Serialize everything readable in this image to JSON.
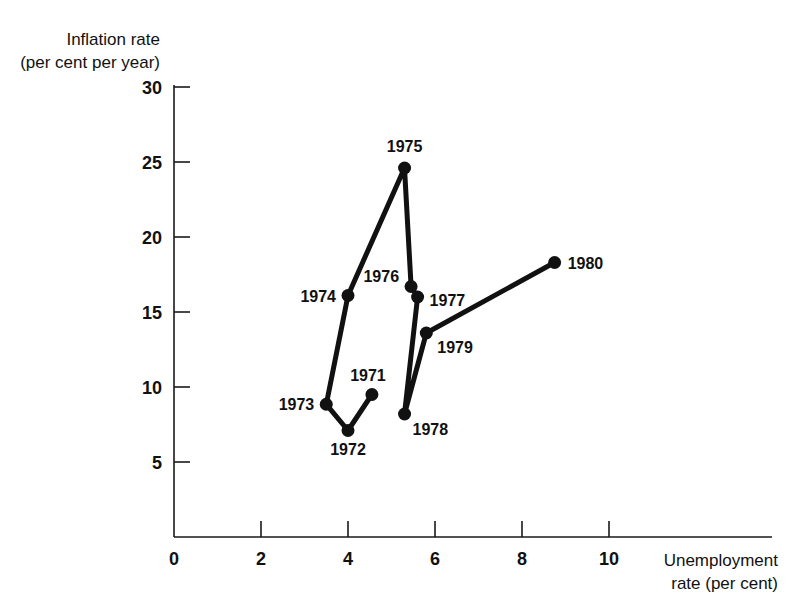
{
  "chart_data": {
    "type": "line",
    "title": "",
    "subtitle": "",
    "xlabel": "Unemployment rate (per cent)",
    "ylabel": "Inflation rate (per cent per year)",
    "xlabel_line1": "Unemployment",
    "xlabel_line2": "rate (per cent)",
    "ylabel_line1": "Inflation rate",
    "ylabel_line2": "(per cent per year)",
    "xlim": [
      0,
      11.2
    ],
    "ylim": [
      0,
      31.5
    ],
    "xticks": [
      0,
      2,
      4,
      6,
      8,
      10
    ],
    "xtick_labels": [
      "0",
      "2",
      "4",
      "6",
      "8",
      "10"
    ],
    "yticks": [
      5,
      10,
      15,
      20,
      25,
      30
    ],
    "ytick_labels": [
      "5",
      "10",
      "15",
      "20",
      "25",
      "30"
    ],
    "grid": false,
    "legend": "none",
    "marker": "filled-circle",
    "line_color": "#111111",
    "marker_color": "#111111",
    "axis_color": "#1a1a1a",
    "connected": true,
    "series": [
      {
        "name": "UK Phillips curve path",
        "points": [
          {
            "label": "1971",
            "x": 4.55,
            "y": 9.5,
            "label_dx": -4,
            "label_dy": -14,
            "anchor": "middle"
          },
          {
            "label": "1972",
            "x": 4.0,
            "y": 7.1,
            "label_dx": 0,
            "label_dy": 24,
            "anchor": "middle"
          },
          {
            "label": "1973",
            "x": 3.5,
            "y": 8.85,
            "label_dx": -12,
            "label_dy": 6,
            "anchor": "end"
          },
          {
            "label": "1974",
            "x": 4.0,
            "y": 16.1,
            "label_dx": -12,
            "label_dy": 6,
            "anchor": "end"
          },
          {
            "label": "1975",
            "x": 5.3,
            "y": 24.6,
            "label_dx": 0,
            "label_dy": -16,
            "anchor": "middle"
          },
          {
            "label": "1976",
            "x": 5.45,
            "y": 16.7,
            "label_dx": -12,
            "label_dy": -5,
            "anchor": "end"
          },
          {
            "label": "1977",
            "x": 5.6,
            "y": 16.0,
            "label_dx": 12,
            "label_dy": 9,
            "anchor": "start"
          },
          {
            "label": "1978",
            "x": 5.3,
            "y": 8.2,
            "label_dx": 8,
            "label_dy": 21,
            "anchor": "start"
          },
          {
            "label": "1979",
            "x": 5.8,
            "y": 13.6,
            "label_dx": 11,
            "label_dy": 20,
            "anchor": "start"
          },
          {
            "label": "1980",
            "x": 8.75,
            "y": 18.3,
            "label_dx": 13,
            "label_dy": 6,
            "anchor": "start"
          }
        ]
      }
    ]
  }
}
